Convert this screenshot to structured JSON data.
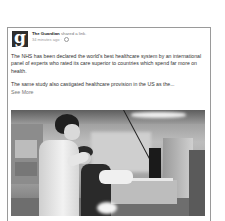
{
  "post": {
    "author": "The Guardian",
    "action": "shared a link.",
    "timestamp": "34 minutes ago",
    "separator": "·",
    "privacy_icon": "globe-icon",
    "logo_letter": "g",
    "paragraphs": [
      "The NHS has been declared the world's best healthcare system by an international panel of experts who rated its care superior to countries which spend far more on health.",
      "The same study also castigated healthcare provision in the US as the..."
    ],
    "see_more": "See More",
    "image": {
      "description": "Grayscale photo of a nurse in a white uniform attending to a patient in a hospital ward with medical equipment"
    }
  },
  "colors": {
    "card_border": "#9a9a9a",
    "logo_bg": "#2e2e2e",
    "text": "#333333",
    "muted": "#9a9a9a"
  }
}
